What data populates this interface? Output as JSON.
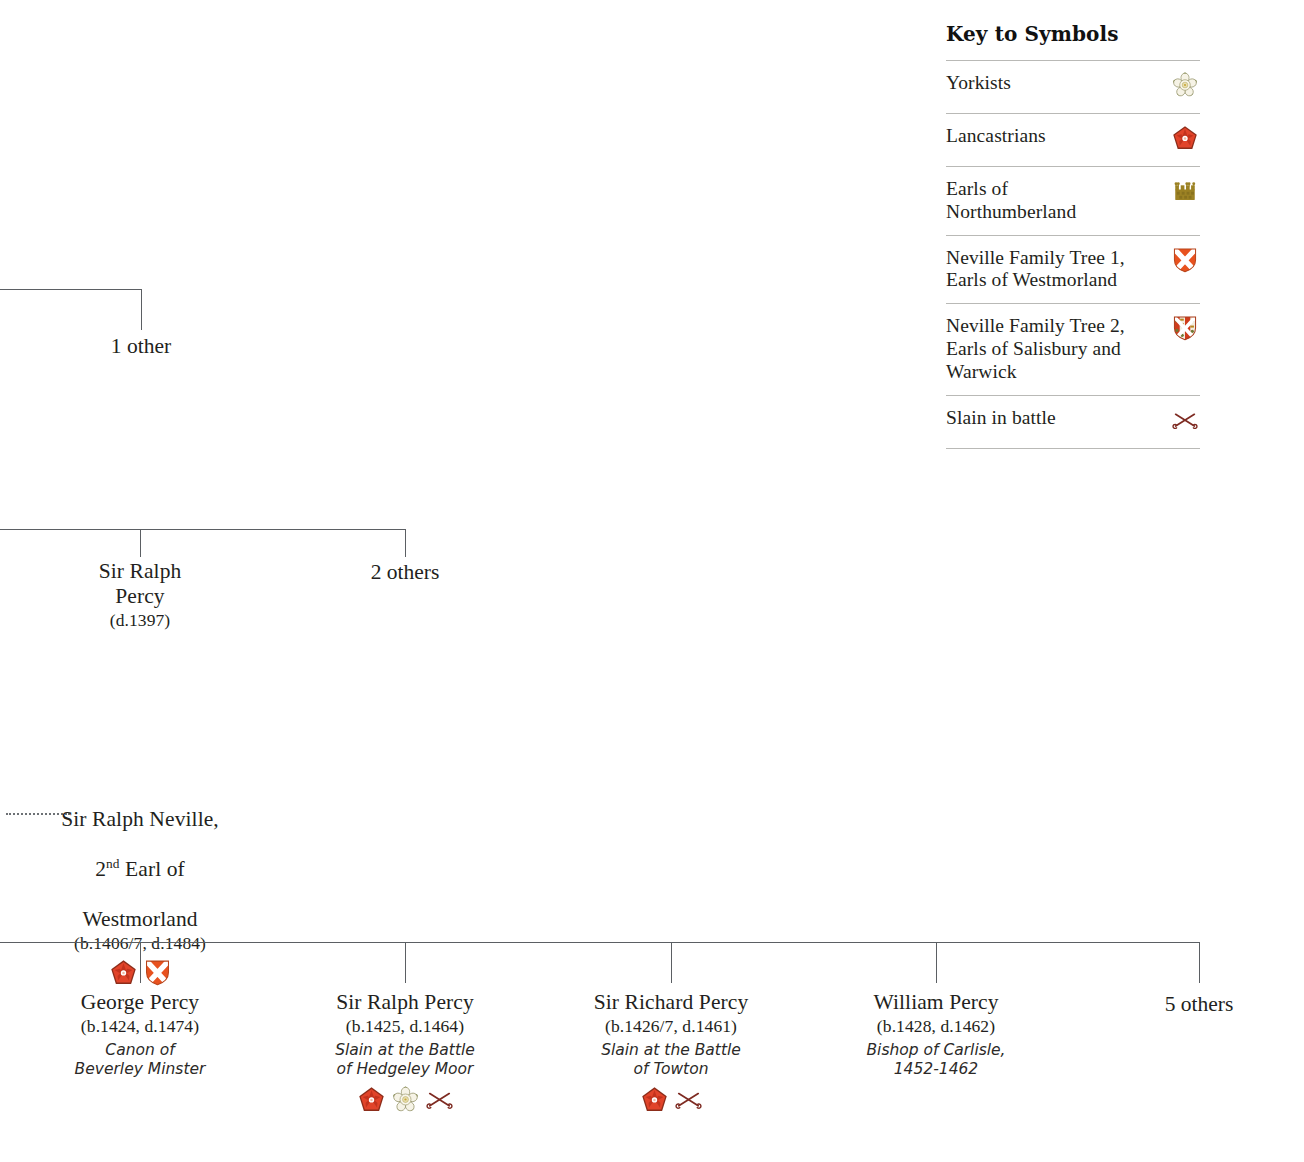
{
  "legend": {
    "title": "Key to Symbols",
    "rows": [
      {
        "label": "Yorkists",
        "icon": "white-rose-icon"
      },
      {
        "label": "Lancastrians",
        "icon": "red-rose-icon"
      },
      {
        "label": "Earls of\nNorthumberland",
        "icon": "crown-icon"
      },
      {
        "label": "Neville Family Tree 1,\nEarls of Westmorland",
        "icon": "westmorland-shield-icon"
      },
      {
        "label": "Neville Family Tree 2,\nEarls of Salisbury and\nWarwick",
        "icon": "salisbury-shield-icon"
      },
      {
        "label": "Slain in battle",
        "icon": "crossed-swords-icon"
      }
    ]
  },
  "tree": {
    "generation1": {
      "others_label": "1 other"
    },
    "generation2": {
      "ralph_percy": {
        "name": "Sir Ralph\nPercy",
        "dates": "(d.1397)"
      },
      "others_label": "2 others"
    },
    "generation3": {
      "neville": {
        "name_line1": "Sir Ralph Neville,",
        "name_ordinal_number": "2",
        "name_ordinal_suffix": "nd",
        "name_line2_rest": " Earl of",
        "name_line3": "Westmorland",
        "dates": "(b.1406/7, d.1484)",
        "badges": [
          "red-rose-icon",
          "westmorland-shield-icon"
        ]
      }
    },
    "generation4": {
      "children": [
        {
          "name": "George Percy",
          "dates": "(b.1424, d.1474)",
          "note": "Canon of\nBeverley Minster",
          "badges": []
        },
        {
          "name": "Sir Ralph Percy",
          "dates": "(b.1425, d.1464)",
          "note": "Slain at the Battle\nof Hedgeley Moor",
          "badges": [
            "red-rose-icon",
            "white-rose-icon",
            "crossed-swords-icon"
          ]
        },
        {
          "name": "Sir Richard Percy",
          "dates": "(b.1426/7, d.1461)",
          "note": "Slain at the Battle\nof Towton",
          "badges": [
            "red-rose-icon",
            "crossed-swords-icon"
          ]
        },
        {
          "name": "William Percy",
          "dates": "(b.1428, d.1462)",
          "note": "Bishop of Carlisle,\n1452-1462",
          "badges": []
        }
      ],
      "others_label": "5 others"
    }
  },
  "colors": {
    "line": "#5b5f63",
    "text": "#231f20",
    "lancaster_red": "#e1442a",
    "lancaster_dark": "#8c2d1a",
    "york_cream": "#f4f1e4",
    "york_green": "#6f7a33",
    "york_gold": "#c8a63b",
    "crown_gold": "#9c8224",
    "shield_orange": "#e8521f",
    "sword_maroon": "#7e2b22",
    "rule": "#b9b9b6"
  }
}
